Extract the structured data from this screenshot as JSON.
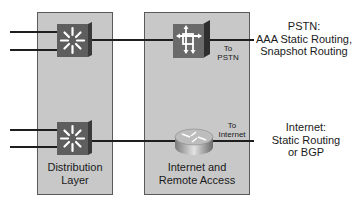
{
  "panels": {
    "distribution": {
      "label_line1": "Distribution",
      "label_line2": "Layer"
    },
    "remote": {
      "label_line1": "Internet and",
      "label_line2": "Remote Access"
    }
  },
  "link_labels": {
    "pstn": {
      "line1": "To",
      "line2": "PSTN"
    },
    "internet": {
      "line1": "To",
      "line2": "Internet"
    }
  },
  "annotations": {
    "pstn": {
      "line1": "PSTN:",
      "line2": "AAA Static Routing,",
      "line3": "Snapshot Routing"
    },
    "internet": {
      "line1": "Internet:",
      "line2": "Static Routing",
      "line3": "or BGP"
    }
  },
  "icons": {
    "top_switch": "multilayer-switch-icon",
    "bottom_switch": "multilayer-switch-icon",
    "pstn_device": "access-server-icon",
    "internet_device": "router-icon"
  },
  "colors": {
    "panel": "#c8c8c8",
    "switch": "#5e5e5e",
    "line": "#1e1e1e"
  }
}
